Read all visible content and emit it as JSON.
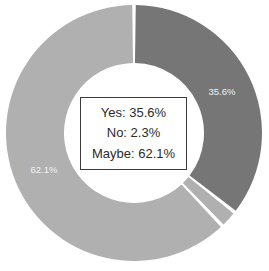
{
  "chart_data": {
    "type": "pie",
    "variant": "donut",
    "title": "",
    "subtitle": "",
    "xlabel": "",
    "ylabel": "",
    "categories": [
      "Yes",
      "No",
      "Maybe"
    ],
    "values": [
      35.6,
      2.3,
      62.1
    ],
    "value_unit": "%",
    "slices": [
      {
        "label": "Yes",
        "value": 35.6,
        "value_text": "35.6%",
        "color": "#767676",
        "label_color": "#f2f2f2",
        "start_angle_deg": 0,
        "end_angle_deg": 128.16,
        "label_shown": true
      },
      {
        "label": "No",
        "value": 2.3,
        "value_text": "2.3%",
        "color": "#b0b0b0",
        "label_color": "#f2f2f2",
        "start_angle_deg": 128.16,
        "end_angle_deg": 136.44,
        "label_shown": false
      },
      {
        "label": "Maybe",
        "value": 62.1,
        "value_text": "62.1%",
        "color": "#b0b0b0",
        "label_color": "#f2f2f2",
        "start_angle_deg": 136.44,
        "end_angle_deg": 360,
        "label_shown": true
      }
    ],
    "data_labels": [
      {
        "text": "35.6%",
        "x": 222,
        "y": 92
      },
      {
        "text": "62.1%",
        "x": 44,
        "y": 170
      }
    ],
    "legend": {
      "position": "center",
      "visible": true
    },
    "grid": false,
    "geometry": {
      "center_x": 134,
      "center_y": 133,
      "outer_radius": 128,
      "inner_radius": 70,
      "start_angle_deg": 0,
      "direction": "clockwise",
      "gap_deg": 1.6,
      "background": "#ffffff"
    }
  },
  "center_box": {
    "lines": [
      "Yes: 35.6%",
      "No: 2.3%",
      "Maybe: 62.1%"
    ],
    "border_color": "#3c3c3c",
    "background": "#ffffff",
    "text_color": "#2b2b2b"
  }
}
